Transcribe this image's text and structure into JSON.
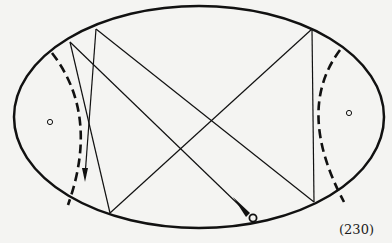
{
  "figure": {
    "caption": "(230)",
    "colors": {
      "ink": "#111111",
      "background": "#f4f4f2"
    },
    "ellipse": {
      "cx": 199,
      "cy": 117,
      "rx": 185,
      "ry": 111
    },
    "foci": [
      {
        "name": "left-focus",
        "x": 50,
        "y": 122
      },
      {
        "name": "right-focus",
        "x": 349,
        "y": 113
      }
    ],
    "points": {
      "A": [
        70,
        42
      ],
      "B": [
        96,
        29
      ],
      "C": [
        312,
        29
      ],
      "D": [
        110,
        213
      ],
      "E": [
        314,
        202
      ],
      "cue": [
        253,
        218
      ],
      "arrow_tip": [
        85,
        180
      ]
    }
  }
}
